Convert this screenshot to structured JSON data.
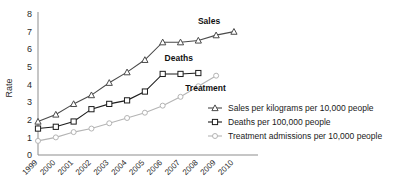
{
  "chart_data": {
    "type": "line",
    "title": "",
    "xlabel": "",
    "ylabel": "Rate",
    "ylim": [
      0,
      8
    ],
    "yticks": [
      0,
      1,
      2,
      3,
      4,
      5,
      6,
      7,
      8
    ],
    "grid": false,
    "legend_position": "bottom-right",
    "categories": [
      "1999",
      "2000",
      "2001",
      "2002",
      "2003",
      "2004",
      "2005",
      "2006",
      "2007",
      "2008",
      "2009",
      "2010"
    ],
    "series": [
      {
        "name": "Sales per kilograms per 10,000 people",
        "short_name": "Sales",
        "marker": "triangle",
        "color": "#4a4a4a",
        "values": [
          1.9,
          2.3,
          2.9,
          3.4,
          4.1,
          4.7,
          5.4,
          6.4,
          6.4,
          6.5,
          6.8,
          7.0
        ]
      },
      {
        "name": "Deaths per 100,000 people",
        "short_name": "Deaths",
        "marker": "square",
        "color": "#1c1c1c",
        "values": [
          1.5,
          1.6,
          1.9,
          2.6,
          2.9,
          3.1,
          3.6,
          4.6,
          4.6,
          4.65,
          null,
          null
        ]
      },
      {
        "name": "Treatment admissions per 10,000 people",
        "short_name": "Treatment",
        "marker": "circle",
        "color": "#b4b4b4",
        "values": [
          0.8,
          1.0,
          1.3,
          1.5,
          1.8,
          2.1,
          2.4,
          2.8,
          3.3,
          3.9,
          4.5,
          null
        ]
      }
    ],
    "inline_labels": [
      {
        "text": "Sales",
        "x_index": 9.6,
        "y_value": 7.45
      },
      {
        "text": "Deaths",
        "x_index": 7.9,
        "y_value": 5.35
      },
      {
        "text": "Treatment",
        "x_index": 9.4,
        "y_value": 3.65
      }
    ],
    "legend": [
      {
        "label": "Sales per kilograms per 10,000 people",
        "marker": "triangle",
        "color": "#4a4a4a"
      },
      {
        "label": "Deaths per 100,000 people",
        "marker": "square",
        "color": "#1c1c1c"
      },
      {
        "label": "Treatment admissions per 10,000 people",
        "marker": "circle",
        "color": "#b4b4b4"
      }
    ]
  },
  "axis": {
    "y_label": "Rate",
    "y_tick_0": "0",
    "y_tick_1": "1",
    "y_tick_2": "2",
    "y_tick_3": "3",
    "y_tick_4": "4",
    "y_tick_5": "5",
    "y_tick_6": "6",
    "y_tick_7": "7",
    "y_tick_8": "8"
  }
}
